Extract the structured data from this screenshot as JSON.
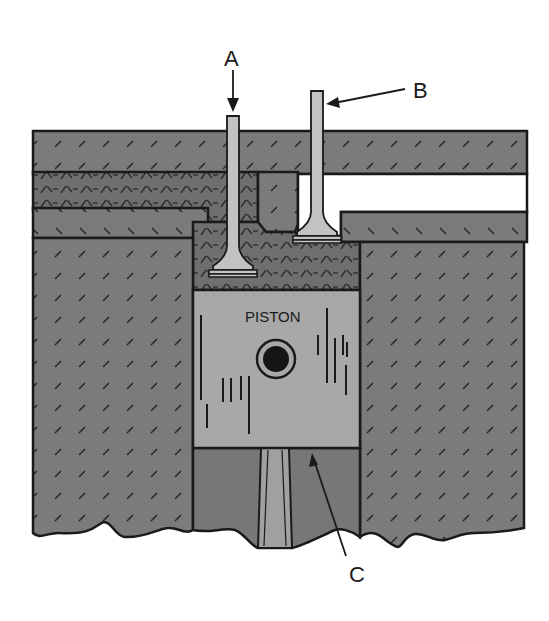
{
  "diagram": {
    "labels": {
      "a": "A",
      "b": "B",
      "c": "C",
      "piston": "PISTON"
    },
    "callouts": [
      {
        "id": "A",
        "points_to": "intake valve (left valve, open)"
      },
      {
        "id": "B",
        "points_to": "exhaust valve (right valve, closed stem)"
      },
      {
        "id": "C",
        "points_to": "piston bottom / crown edge"
      }
    ],
    "colors": {
      "block": "#7d7d7d",
      "mesh": "#6e6e6e",
      "piston": "#a6a6a6",
      "valve": "#bdbdbd",
      "outline": "#1a1a1a",
      "port_open": "#ffffff"
    }
  }
}
